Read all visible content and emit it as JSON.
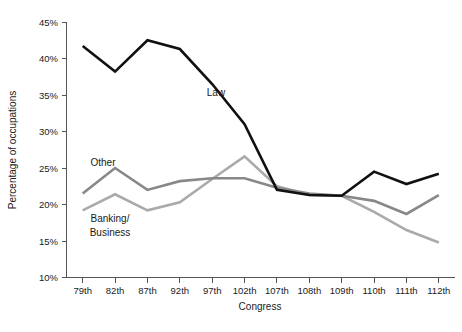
{
  "chart_data": {
    "type": "line",
    "title": "",
    "subtitle": "",
    "xlabel": "Congress",
    "ylabel": "Percentage of occupations",
    "categories": [
      "79th",
      "82th",
      "87th",
      "92th",
      "97th",
      "102th",
      "107th",
      "108th",
      "109th",
      "110th",
      "111th",
      "112th"
    ],
    "ylim": [
      10,
      45
    ],
    "ytick_labels": [
      "10%",
      "15%",
      "20%",
      "25%",
      "30%",
      "35%",
      "40%",
      "45%"
    ],
    "ytick_values": [
      10,
      15,
      20,
      25,
      30,
      35,
      40,
      45
    ],
    "grid": false,
    "legend_position": "inline-annotations",
    "series": [
      {
        "name": "Law",
        "color": "#111111",
        "width": 2.6,
        "values": [
          41.7,
          38.2,
          42.5,
          41.3,
          36.5,
          31.0,
          22.0,
          21.3,
          21.2,
          24.5,
          22.8,
          24.2
        ]
      },
      {
        "name": "Other",
        "color": "#888888",
        "width": 2.6,
        "values": [
          21.5,
          25.0,
          22.0,
          23.2,
          23.6,
          23.6,
          22.3,
          21.5,
          21.2,
          20.5,
          18.7,
          21.3
        ]
      },
      {
        "name": "Banking/Business",
        "color": "#aaaaaa",
        "width": 2.6,
        "values": [
          19.2,
          21.4,
          19.2,
          20.3,
          23.5,
          26.6,
          22.5,
          21.3,
          21.2,
          19.0,
          16.5,
          14.8
        ]
      }
    ],
    "annotations": [
      {
        "text": "Law",
        "series": "Law",
        "x_px": 216,
        "y_px": 96
      },
      {
        "text": "Other",
        "series": "Other",
        "x_px": 103,
        "y_px": 166
      },
      {
        "text": "Banking/",
        "series": "Banking/Business",
        "x_px": 110,
        "y_px": 222
      },
      {
        "text": "Business",
        "series": "Banking/Business",
        "x_px": 110,
        "y_px": 236
      }
    ]
  },
  "axes": {
    "y_axis_title": "Percentage of occupations",
    "x_axis_title": "Congress"
  }
}
